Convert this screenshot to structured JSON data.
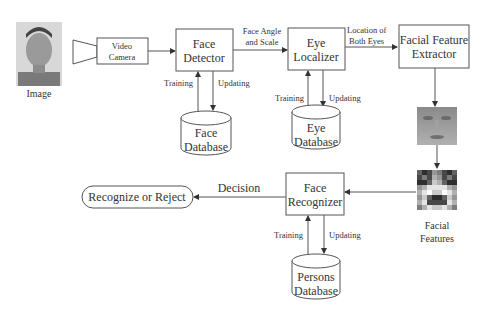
{
  "diagram": {
    "input_image_label": "Image",
    "video_camera": [
      "Video",
      "Camera"
    ],
    "face_detector": [
      "Face",
      "Detector"
    ],
    "face_angle_label": [
      "Face Angle",
      "and Scale"
    ],
    "eye_localizer": [
      "Eye",
      "Localizer"
    ],
    "location_label": [
      "Location of",
      "Both Eyes"
    ],
    "facial_feature_extractor": [
      "Facial Feature",
      "Extractor"
    ],
    "face_database": [
      "Face",
      "Database"
    ],
    "eye_database": [
      "Eye",
      "Database"
    ],
    "persons_database": [
      "Persons",
      "Database"
    ],
    "face_recognizer": [
      "Face",
      "Recognizer"
    ],
    "recognize_or_reject": "Recognize or Reject",
    "decision_label": "Decision",
    "facial_features_label": [
      "Facial",
      "Features"
    ],
    "training_label": "Training",
    "updating_label": "Updating"
  }
}
